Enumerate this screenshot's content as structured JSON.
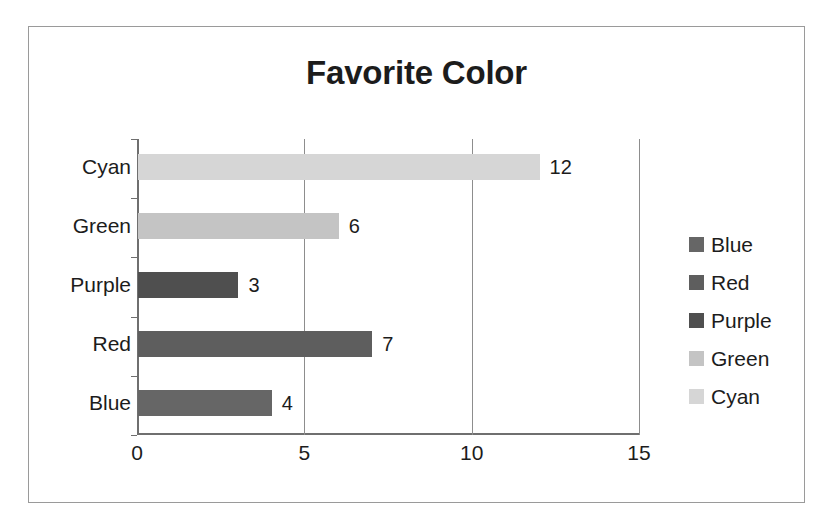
{
  "chart_data": {
    "type": "bar",
    "orientation": "horizontal",
    "title": "Favorite Color",
    "categories": [
      "Blue",
      "Red",
      "Purple",
      "Green",
      "Cyan"
    ],
    "values": [
      4,
      7,
      3,
      6,
      12
    ],
    "data_labels": [
      "4",
      "7",
      "3",
      "6",
      "12"
    ],
    "display_order_top_to_bottom": [
      "Cyan",
      "Green",
      "Purple",
      "Red",
      "Blue"
    ],
    "xlabel": "",
    "ylabel": "",
    "xlim": [
      0,
      15
    ],
    "xticks": [
      0,
      5,
      10,
      15
    ],
    "xtick_labels": [
      "0",
      "5",
      "10",
      "15"
    ],
    "grid": "vertical",
    "legend_position": "right",
    "legend": [
      {
        "label": "Blue",
        "color": "#666666"
      },
      {
        "label": "Red",
        "color": "#5e5e5e"
      },
      {
        "label": "Purple",
        "color": "#4f4f4f"
      },
      {
        "label": "Green",
        "color": "#c4c4c4"
      },
      {
        "label": "Cyan",
        "color": "#d6d6d6"
      }
    ],
    "bars": [
      {
        "category": "Cyan",
        "value": 12,
        "label": "12",
        "color": "#d6d6d6"
      },
      {
        "category": "Green",
        "value": 6,
        "label": "6",
        "color": "#c4c4c4"
      },
      {
        "category": "Purple",
        "value": 3,
        "label": "3",
        "color": "#4f4f4f"
      },
      {
        "category": "Red",
        "value": 7,
        "label": "7",
        "color": "#5e5e5e"
      },
      {
        "category": "Blue",
        "value": 4,
        "label": "4",
        "color": "#666666"
      }
    ]
  },
  "style": {
    "axis_color": "#6f6f6f",
    "grid_color": "#8d8d8d",
    "border_color": "#9a9a9a",
    "text_color": "#1c1c1c",
    "background": "#ffffff"
  }
}
